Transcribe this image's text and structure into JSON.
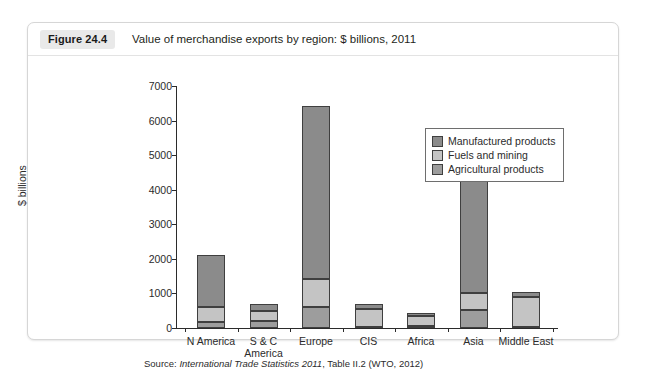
{
  "figure": {
    "badge": "Figure 24.4",
    "title": "Value of merchandise exports by region: $ billions, 2011",
    "source_prefix": "Source: ",
    "source_italic": "International Trade Statistics 2011",
    "source_suffix": ", Table II.2 (WTO, 2012)"
  },
  "legend": {
    "items": [
      {
        "label": "Manufactured products",
        "color": "#8b8b8b"
      },
      {
        "label": "Fuels and mining",
        "color": "#c4c4c4"
      },
      {
        "label": "Agricultural products",
        "color": "#9d9d9d"
      }
    ]
  },
  "axis": {
    "y_title": "$ billions",
    "y_ticks": [
      "0",
      "1000",
      "2000",
      "3000",
      "4000",
      "5000",
      "6000",
      "7000"
    ]
  },
  "chart_data": {
    "type": "bar",
    "subtype": "stacked",
    "title": "Value of merchandise exports by region: $ billions, 2011",
    "xlabel": "",
    "ylabel": "$ billions",
    "ylim": [
      0,
      7000
    ],
    "ytick_step": 1000,
    "grid": false,
    "legend_position": "top-right-inside",
    "categories": [
      "N America",
      "S & C\nAmerica",
      "Europe",
      "CIS",
      "Africa",
      "Asia",
      "Middle East"
    ],
    "category_labels": [
      "N America",
      "S & C America",
      "Europe",
      "CIS",
      "Africa",
      "Asia",
      "Middle East"
    ],
    "series": [
      {
        "name": "Agricultural products",
        "color": "#9d9d9d",
        "values": [
          180,
          190,
          620,
          40,
          60,
          520,
          40
        ]
      },
      {
        "name": "Fuels and mining",
        "color": "#c4c4c4",
        "values": [
          440,
          310,
          810,
          520,
          300,
          500,
          860
        ]
      },
      {
        "name": "Manufactured products",
        "color": "#8b8b8b",
        "values": [
          1490,
          180,
          5000,
          120,
          70,
          4210,
          150
        ]
      }
    ],
    "totals": [
      2110,
      680,
      6430,
      680,
      430,
      5230,
      1050
    ]
  }
}
